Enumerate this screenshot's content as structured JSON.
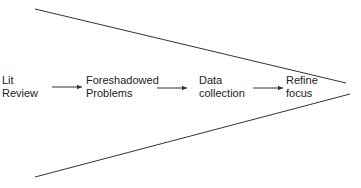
{
  "diagram": {
    "type": "funnel-flow",
    "nodes": [
      {
        "id": "lit",
        "lines": [
          "Lit",
          "Review"
        ]
      },
      {
        "id": "fore",
        "lines": [
          "Foreshadowed",
          "Problems"
        ]
      },
      {
        "id": "data",
        "lines": [
          "Data",
          "collection"
        ]
      },
      {
        "id": "refine",
        "lines": [
          "Refine",
          "focus"
        ]
      }
    ],
    "edges": [
      {
        "from": "lit",
        "to": "fore"
      },
      {
        "from": "fore",
        "to": "data"
      },
      {
        "from": "data",
        "to": "refine"
      }
    ],
    "funnel": {
      "shape": "converging-lines",
      "direction": "left-to-right"
    },
    "colors": {
      "line": "#333333",
      "text": "#222222"
    }
  }
}
